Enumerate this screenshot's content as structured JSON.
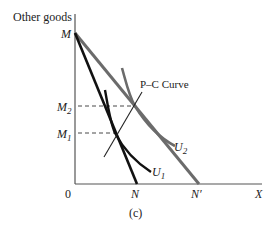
{
  "diagram": {
    "y_axis_label": "Other goods",
    "x_axis_label": "X",
    "origin_label": "0",
    "caption": "(c)",
    "y_ticks": {
      "M": "M",
      "M2": "M",
      "M2_sub": "2",
      "M1": "M",
      "M1_sub": "1"
    },
    "x_ticks": {
      "N": "N",
      "N_prime": "N′"
    },
    "curves": {
      "pc_curve_label": "P–C Curve",
      "u1_label": "U",
      "u1_sub": "1",
      "u2_label": "U",
      "u2_sub": "2"
    },
    "colors": {
      "axis": "#555555",
      "budget_line_1": "#111111",
      "budget_line_2": "#6b6b6b",
      "u1": "#111111",
      "u2": "#6b6b6b",
      "pc_curve": "#222222",
      "dashed": "#333333"
    }
  }
}
